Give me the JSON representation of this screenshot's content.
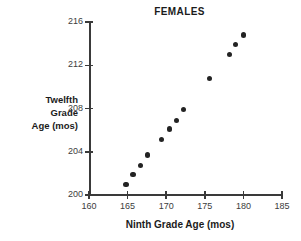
{
  "chart_data": {
    "type": "scatter",
    "title": "FEMALES",
    "xlabel": "Ninth Grade Age (mos)",
    "ylabel": "Twelfth Grade Age (mos)",
    "ylabel_lines": [
      "Twelfth",
      "Grade",
      "Age (mos)"
    ],
    "xlim": [
      160,
      185
    ],
    "ylim": [
      200,
      216
    ],
    "xticks": [
      160,
      165,
      170,
      175,
      180,
      185
    ],
    "yticks": [
      200,
      204,
      208,
      212,
      216
    ],
    "grid": false,
    "legend": false,
    "marker": "filled-circle",
    "marker_color": "#232323",
    "points": [
      {
        "x": 164.8,
        "y": 201.0
      },
      {
        "x": 165.7,
        "y": 201.9
      },
      {
        "x": 166.7,
        "y": 202.7
      },
      {
        "x": 167.6,
        "y": 203.7
      },
      {
        "x": 169.4,
        "y": 205.1
      },
      {
        "x": 170.4,
        "y": 206.1
      },
      {
        "x": 171.3,
        "y": 206.9
      },
      {
        "x": 172.2,
        "y": 207.9
      },
      {
        "x": 175.6,
        "y": 210.8
      },
      {
        "x": 178.2,
        "y": 213.0
      },
      {
        "x": 179.0,
        "y": 213.9
      },
      {
        "x": 180.0,
        "y": 214.8
      }
    ]
  },
  "accent": {
    "axis_color": "#3a3a3a",
    "text_color": "#1b1b1b",
    "tick_label_color": "#3c3c3c"
  }
}
